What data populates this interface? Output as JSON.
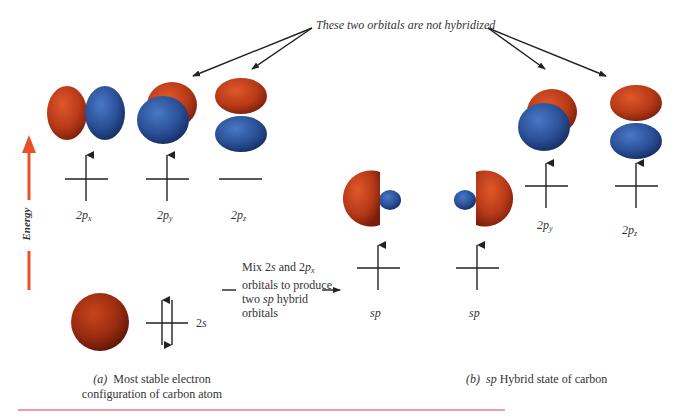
{
  "annotation": {
    "text": "These two orbitals are not hybridized"
  },
  "energy_axis": {
    "label": "Energy",
    "color": "#e8502a"
  },
  "colors": {
    "lobe_red": "#c0401c",
    "lobe_blue": "#2c56a0",
    "line": "#333333",
    "rule_red": "#e23a4e"
  },
  "panel_a": {
    "orbitals": [
      {
        "id": "2px",
        "main": "2p",
        "sub": "x",
        "electrons": "up"
      },
      {
        "id": "2py",
        "main": "2p",
        "sub": "y",
        "electrons": "up"
      },
      {
        "id": "2pz",
        "main": "2p",
        "sub": "z",
        "electrons": "none"
      }
    ],
    "s_orbital": {
      "main": "2s",
      "electrons": "paired"
    },
    "caption_prefix": "(a)",
    "caption_line1": "Most stable electron",
    "caption_line2": "configuration of carbon atom"
  },
  "mix_note": {
    "line1": "Mix 2s and 2px",
    "line1_parts": [
      "Mix 2",
      "s",
      " and 2",
      "p",
      "x"
    ],
    "line2": "orbitals to produce",
    "line3_parts": [
      "two ",
      "sp",
      " hybrid"
    ],
    "line4": "orbitals"
  },
  "panel_b": {
    "hybrids": [
      {
        "label": "sp",
        "electrons": "up"
      },
      {
        "label": "sp",
        "electrons": "up"
      }
    ],
    "orbitals": [
      {
        "id": "2py",
        "main": "2p",
        "sub": "y",
        "electrons": "up"
      },
      {
        "id": "2pz",
        "main": "2p",
        "sub": "z",
        "electrons": "up"
      }
    ],
    "caption_prefix": "(b)",
    "caption_italic": "sp",
    "caption_rest": "Hybrid state of carbon"
  }
}
